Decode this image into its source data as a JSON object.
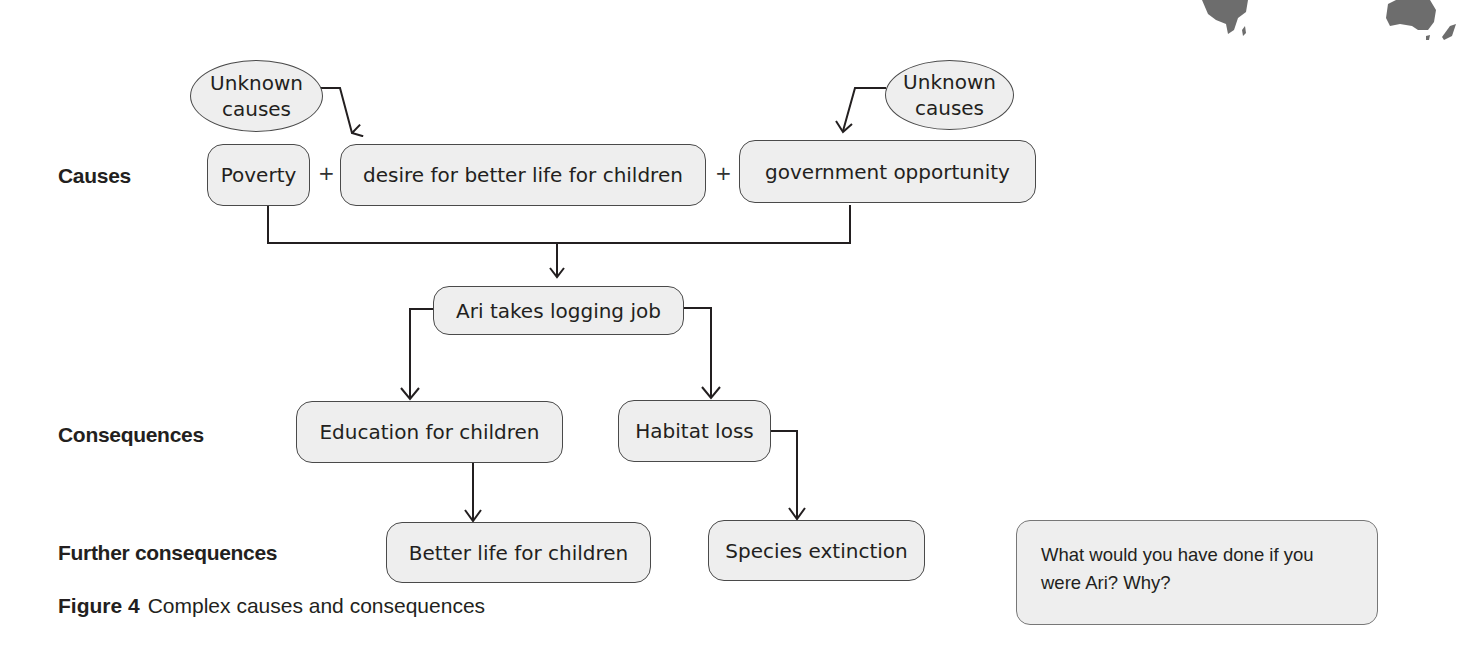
{
  "rows": {
    "causes": "Causes",
    "consequences": "Consequences",
    "further": "Further consequences"
  },
  "unknown_left": {
    "line1": "Unknown",
    "line2": "causes"
  },
  "unknown_right": {
    "line1": "Unknown",
    "line2": "causes"
  },
  "causes": [
    "Poverty",
    "desire for better life for children",
    "government opportunity"
  ],
  "plus": "+",
  "central": "Ari takes logging job",
  "consequences": [
    "Education for children",
    "Habitat loss"
  ],
  "further_consequences": [
    "Better life for children",
    "Species extinction"
  ],
  "caption": {
    "label": "Figure 4",
    "text": "Complex causes and consequences"
  },
  "question": "What would you have done if you were Ari? Why?",
  "colors": {
    "box_fill": "#eeeeee",
    "box_border": "#4a4a4a",
    "text": "#231f20",
    "map": "#6d6d6d"
  }
}
